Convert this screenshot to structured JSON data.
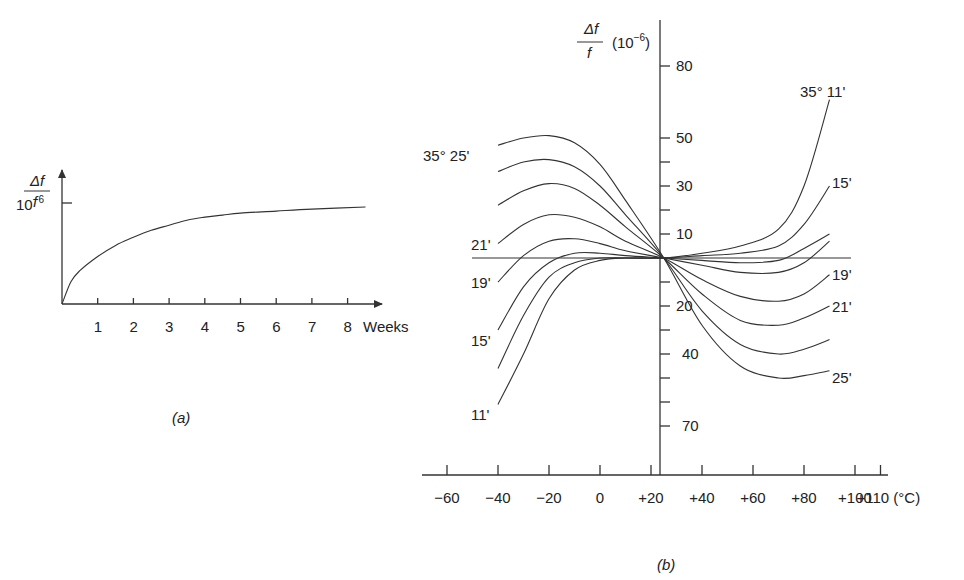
{
  "chart_data": [
    {
      "id": "a",
      "type": "line",
      "panel_label": "(a)",
      "title": "",
      "ylabel": "Δf / f",
      "xlabel": "Weeks",
      "x_ticks": [
        "1",
        "2",
        "3",
        "4",
        "5",
        "6",
        "7",
        "8"
      ],
      "y_ticks": [
        "10^-6"
      ],
      "xlim": [
        0,
        8.5
      ],
      "ylim": [
        0,
        1.1
      ],
      "series": [
        {
          "name": "aging",
          "x": [
            0,
            0.25,
            0.5,
            1,
            1.5,
            2,
            2.5,
            3,
            3.5,
            4,
            4.5,
            5,
            6,
            7,
            8.5
          ],
          "y": [
            0,
            0.22,
            0.33,
            0.47,
            0.58,
            0.66,
            0.73,
            0.78,
            0.83,
            0.86,
            0.88,
            0.9,
            0.92,
            0.94,
            0.96
          ]
        }
      ]
    },
    {
      "id": "b",
      "type": "line",
      "panel_label": "(b)",
      "title": "",
      "ylabel": "Δf / f (10^-6)",
      "xlabel": "(°C)",
      "x_ticks": [
        "−60",
        "−40",
        "−20",
        "0",
        "+20",
        "+40",
        "+60",
        "+80",
        "+100",
        "+110"
      ],
      "y_ticks_up": [
        "10",
        "30",
        "50",
        "80"
      ],
      "y_ticks_down": [
        "20",
        "40",
        "70"
      ],
      "xlim": [
        -70,
        115
      ],
      "ylim": [
        -80,
        90
      ],
      "reference_temp": 25,
      "series": [
        {
          "name": "35° 25'",
          "label_left": "35° 25'",
          "label_right": "25'",
          "x": [
            -40,
            -30,
            -20,
            -10,
            0,
            10,
            25,
            40,
            55,
            70,
            80,
            90
          ],
          "y": [
            47,
            50,
            51,
            48,
            39,
            24,
            0,
            -28,
            -45,
            -50,
            -49,
            -47
          ]
        },
        {
          "name": "curve-2",
          "label_left": "",
          "label_right": "",
          "x": [
            -40,
            -30,
            -20,
            -10,
            0,
            10,
            25,
            40,
            55,
            70,
            80,
            90
          ],
          "y": [
            36,
            40,
            41,
            38,
            30,
            18,
            0,
            -22,
            -36,
            -40,
            -38,
            -34
          ]
        },
        {
          "name": "curve-3",
          "label_left": "",
          "label_right": "21'",
          "x": [
            -40,
            -30,
            -20,
            -10,
            0,
            10,
            25,
            40,
            55,
            70,
            80,
            90
          ],
          "y": [
            22,
            28,
            31,
            29,
            22,
            13,
            0,
            -15,
            -26,
            -28,
            -25,
            -20
          ]
        },
        {
          "name": "21'",
          "label_left": "21'",
          "label_right": "",
          "x": [
            -40,
            -30,
            -20,
            -10,
            0,
            10,
            25,
            40,
            55,
            70,
            80,
            90
          ],
          "y": [
            6,
            14,
            18,
            17,
            13,
            7,
            0,
            -9,
            -16,
            -18,
            -15,
            -7
          ]
        },
        {
          "name": "19'",
          "label_left": "19'",
          "label_right": "19'",
          "x": [
            -40,
            -30,
            -20,
            -10,
            0,
            10,
            25,
            40,
            55,
            70,
            80,
            90
          ],
          "y": [
            -10,
            1,
            7,
            8,
            6,
            3,
            0,
            -3,
            -6,
            -6,
            -2,
            7
          ]
        },
        {
          "name": "curve-6",
          "label_left": "",
          "label_right": "",
          "x": [
            -40,
            -30,
            -20,
            -10,
            0,
            10,
            25,
            40,
            55,
            70,
            80,
            90
          ],
          "y": [
            -30,
            -12,
            -2,
            2,
            2,
            1,
            0,
            -1,
            -2,
            -1,
            4,
            10
          ]
        },
        {
          "name": "15'",
          "label_left": "15'",
          "label_right": "15'",
          "x": [
            -40,
            -30,
            -20,
            -10,
            0,
            10,
            25,
            40,
            55,
            70,
            80,
            90
          ],
          "y": [
            -46,
            -24,
            -8,
            -2,
            0,
            0,
            0,
            1,
            2,
            5,
            14,
            30
          ]
        },
        {
          "name": "35° 11'",
          "label_left": "11'",
          "label_right": "35° 11'",
          "x": [
            -40,
            -30,
            -20,
            -10,
            0,
            10,
            25,
            40,
            55,
            70,
            80,
            90
          ],
          "y": [
            -61,
            -40,
            -17,
            -5,
            -1,
            0,
            0,
            2,
            5,
            12,
            30,
            66
          ]
        }
      ],
      "reference_line": {
        "x": [
          -50,
          100
        ],
        "y": [
          0,
          0
        ]
      }
    }
  ],
  "panel_a": {
    "ylabel_num": "Δf",
    "ylabel_den": "f",
    "ytick_label": "10",
    "ytick_exp": "−6",
    "xticks": [
      "1",
      "2",
      "3",
      "4",
      "5",
      "6",
      "7",
      "8"
    ],
    "xlabel": "Weeks",
    "caption": "(a)"
  },
  "panel_b": {
    "ylabel_num": "Δf",
    "ylabel_den": "f",
    "yunit_open": "(10",
    "yunit_exp": "−6",
    "yunit_close": ")",
    "yticks": [
      "80",
      "50",
      "30",
      "10",
      "20",
      "40",
      "70"
    ],
    "xticks": [
      "−60",
      "−40",
      "−20",
      "0",
      "+20",
      "+40",
      "+60",
      "+80",
      "+100",
      "+110 (°C)"
    ],
    "labels": {
      "top_left": "35° 25'",
      "left_21": "21'",
      "left_19": "19'",
      "left_15": "15'",
      "left_11": "11'",
      "top_right": "35° 11'",
      "right_15": "15'",
      "right_19": "19'",
      "right_21": "21'",
      "right_25": "25'"
    },
    "caption": "(b)"
  }
}
